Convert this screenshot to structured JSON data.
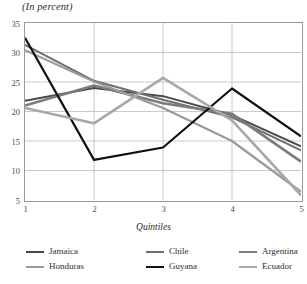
{
  "chart_data": {
    "type": "line",
    "title": "(In percent)",
    "xlabel": "Quintiles",
    "ylabel": "",
    "categories": [
      "1",
      "2",
      "3",
      "4",
      "5"
    ],
    "x": [
      1,
      2,
      3,
      4,
      5
    ],
    "xlim": [
      1,
      5
    ],
    "ylim": [
      5,
      35
    ],
    "yticks": [
      5,
      10,
      15,
      20,
      25,
      30,
      35
    ],
    "xticks": [
      1,
      2,
      3,
      4,
      5
    ],
    "grid": "horizontal-and-vertical",
    "legend_position": "bottom",
    "series": [
      {
        "name": "Jamaica",
        "color": "#4a4a4a",
        "width": 2.0,
        "values": [
          21.8,
          24.0,
          22.6,
          19.4,
          14.1
        ]
      },
      {
        "name": "Chile",
        "color": "#6e6e6e",
        "width": 2.0,
        "values": [
          31.3,
          25.2,
          22.0,
          19.0,
          13.4
        ]
      },
      {
        "name": "Argentina",
        "color": "#7b7b7b",
        "width": 2.6,
        "values": [
          21.0,
          24.4,
          21.4,
          19.6,
          11.5
        ]
      },
      {
        "name": "Honduras",
        "color": "#9a9a9a",
        "width": 2.2,
        "values": [
          30.4,
          25.1,
          20.6,
          15.0,
          6.4
        ]
      },
      {
        "name": "Guyana",
        "color": "#111111",
        "width": 2.2,
        "values": [
          32.5,
          11.8,
          13.9,
          23.9,
          15.8
        ]
      },
      {
        "name": "Ecuador",
        "color": "#a8a8a8",
        "width": 2.6,
        "values": [
          20.6,
          18.0,
          25.7,
          18.5,
          5.8
        ]
      }
    ]
  },
  "axis": {
    "y_tick_labels": [
      "35",
      "30",
      "25",
      "20",
      "15",
      "10",
      "5"
    ],
    "x_tick_labels": [
      "1",
      "2",
      "3",
      "4",
      "5"
    ],
    "x_title": "Quintiles"
  },
  "legend": {
    "items": [
      {
        "label": "Jamaica",
        "color": "#4a4a4a",
        "width": 2.0
      },
      {
        "label": "Chile",
        "color": "#6e6e6e",
        "width": 2.0
      },
      {
        "label": "Argentina",
        "color": "#7b7b7b",
        "width": 2.6
      },
      {
        "label": "Honduras",
        "color": "#9a9a9a",
        "width": 2.2
      },
      {
        "label": "Guyana",
        "color": "#111111",
        "width": 2.2
      },
      {
        "label": "Ecuador",
        "color": "#a8a8a8",
        "width": 2.6
      }
    ]
  },
  "style": {
    "frame_color": "#9b9b9b",
    "grid_color": "#c9c9c9",
    "text_color": "#2e2e2e"
  }
}
